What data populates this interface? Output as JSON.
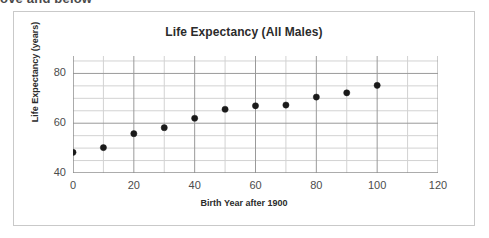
{
  "page": {
    "clipped_text": "ove and below"
  },
  "chart_data": {
    "type": "scatter",
    "title": "Life Expectancy (All Males)",
    "xlabel": "Birth Year after 1900",
    "ylabel": "Life Expectancy (years)",
    "xlim": [
      0,
      120
    ],
    "ylim": [
      40,
      87
    ],
    "x_ticks": [
      0,
      20,
      40,
      60,
      80,
      100,
      120
    ],
    "y_ticks": [
      40,
      60,
      80
    ],
    "x_tick_labels": [
      "0",
      "20",
      "40",
      "60",
      "80",
      "100",
      "120"
    ],
    "y_tick_labels": [
      "40",
      "60",
      "80"
    ],
    "x_minor_step": 10,
    "y_minor_step": 5,
    "grid": true,
    "legend": "none",
    "marker": {
      "shape": "circle",
      "color": "#1a1a1a",
      "size": 5
    },
    "x": [
      0,
      10,
      20,
      30,
      40,
      50,
      60,
      70,
      80,
      90,
      100
    ],
    "values": [
      48.3,
      50.2,
      55.8,
      58.2,
      62.0,
      65.6,
      67.0,
      67.3,
      70.5,
      72.2,
      75.2
    ],
    "series": [
      {
        "name": "All Males",
        "points": [
          {
            "x": 0,
            "y": 48.3
          },
          {
            "x": 10,
            "y": 50.2
          },
          {
            "x": 20,
            "y": 55.8
          },
          {
            "x": 30,
            "y": 58.2
          },
          {
            "x": 40,
            "y": 62.0
          },
          {
            "x": 50,
            "y": 65.6
          },
          {
            "x": 60,
            "y": 67.0
          },
          {
            "x": 70,
            "y": 67.3
          },
          {
            "x": 80,
            "y": 70.5
          },
          {
            "x": 90,
            "y": 72.2
          },
          {
            "x": 100,
            "y": 75.2
          }
        ]
      }
    ]
  }
}
